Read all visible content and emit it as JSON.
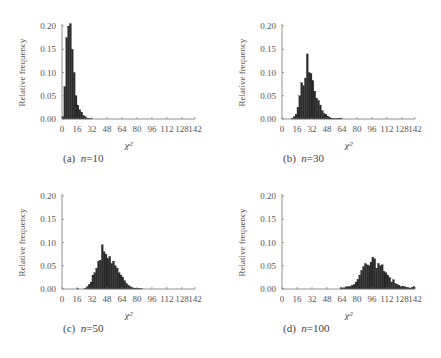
{
  "figure": {
    "bar_color": "#2b2b2b",
    "axis_color": "#777777"
  },
  "chart_data": [
    {
      "type": "bar",
      "panel": "a",
      "caption_prefix": "(a)",
      "caption_var": "n",
      "caption_value": "=10",
      "xlabel": "χ²",
      "ylabel": "Relative frequency",
      "ylim": [
        0,
        0.2
      ],
      "xlim": [
        0,
        142
      ],
      "yticks": [
        "0.00",
        "0.05",
        "0.10",
        "0.15",
        "0.20"
      ],
      "xticks": [
        "0",
        "16",
        "32",
        "48",
        "64",
        "80",
        "96",
        "112",
        "128",
        "142"
      ],
      "bin_width": 2,
      "x": [
        0,
        2,
        4,
        6,
        8,
        10,
        12,
        14,
        16,
        18,
        20,
        22,
        24,
        26,
        28,
        30
      ],
      "values": [
        0.005,
        0.07,
        0.175,
        0.2,
        0.205,
        0.15,
        0.1,
        0.05,
        0.03,
        0.02,
        0.015,
        0.008,
        0.005,
        0.002,
        0.001,
        0.001
      ]
    },
    {
      "type": "bar",
      "panel": "b",
      "caption_prefix": "(b)",
      "caption_var": "n",
      "caption_value": "=30",
      "xlabel": "χ²",
      "ylabel": "Relative frequency",
      "ylim": [
        0,
        0.2
      ],
      "xlim": [
        0,
        142
      ],
      "yticks": [
        "0.00",
        "0.05",
        "0.10",
        "0.15",
        "0.20"
      ],
      "xticks": [
        "0",
        "16",
        "32",
        "48",
        "64",
        "80",
        "96",
        "112",
        "128",
        "142"
      ],
      "bin_width": 2,
      "x": [
        10,
        12,
        14,
        16,
        18,
        20,
        22,
        24,
        26,
        28,
        30,
        32,
        34,
        36,
        38,
        40,
        42,
        44,
        46,
        48,
        50,
        52,
        54,
        56,
        58,
        60,
        62
      ],
      "values": [
        0.002,
        0.005,
        0.01,
        0.025,
        0.05,
        0.078,
        0.072,
        0.088,
        0.14,
        0.1,
        0.098,
        0.082,
        0.06,
        0.045,
        0.04,
        0.03,
        0.018,
        0.012,
        0.01,
        0.006,
        0.004,
        0.002,
        0.001,
        0.001,
        0.001,
        0.002,
        0.001
      ]
    },
    {
      "type": "bar",
      "panel": "c",
      "caption_prefix": "(c)",
      "caption_var": "n",
      "caption_value": "=50",
      "xlabel": "χ²",
      "ylabel": "Relative frequency",
      "ylim": [
        0,
        0.2
      ],
      "xlim": [
        0,
        142
      ],
      "yticks": [
        "0.00",
        "0.05",
        "0.10",
        "0.15",
        "0.20"
      ],
      "xticks": [
        "0",
        "16",
        "32",
        "48",
        "64",
        "80",
        "96",
        "112",
        "128",
        "142"
      ],
      "bin_width": 2,
      "x": [
        16,
        24,
        26,
        28,
        30,
        32,
        34,
        36,
        38,
        40,
        42,
        44,
        46,
        48,
        50,
        52,
        54,
        56,
        58,
        60,
        62,
        64,
        66,
        68,
        70,
        72,
        74,
        76,
        78,
        80,
        82,
        84
      ],
      "values": [
        0.001,
        0.002,
        0.005,
        0.01,
        0.015,
        0.03,
        0.035,
        0.045,
        0.06,
        0.062,
        0.095,
        0.08,
        0.075,
        0.065,
        0.07,
        0.055,
        0.06,
        0.05,
        0.045,
        0.035,
        0.03,
        0.025,
        0.018,
        0.012,
        0.008,
        0.005,
        0.003,
        0.002,
        0.002,
        0.001,
        0.001,
        0.001
      ]
    },
    {
      "type": "bar",
      "panel": "d",
      "caption_prefix": "(d)",
      "caption_var": "n",
      "caption_value": "=100",
      "xlabel": "χ²",
      "ylabel": "Relative frequency",
      "ylim": [
        0,
        0.2
      ],
      "xlim": [
        0,
        142
      ],
      "yticks": [
        "0.00",
        "0.05",
        "0.10",
        "0.15",
        "0.20"
      ],
      "xticks": [
        "0",
        "16",
        "32",
        "48",
        "64",
        "80",
        "96",
        "112",
        "128",
        "142"
      ],
      "bin_width": 2,
      "x": [
        62,
        64,
        66,
        68,
        70,
        72,
        74,
        76,
        78,
        80,
        82,
        84,
        86,
        88,
        90,
        92,
        94,
        96,
        98,
        100,
        102,
        104,
        106,
        108,
        110,
        112,
        114,
        116,
        118,
        120,
        122,
        124,
        126,
        128,
        130,
        132,
        134,
        136,
        138,
        140
      ],
      "values": [
        0.003,
        0.001,
        0.003,
        0.005,
        0.005,
        0.006,
        0.008,
        0.01,
        0.015,
        0.02,
        0.03,
        0.04,
        0.048,
        0.055,
        0.052,
        0.05,
        0.058,
        0.068,
        0.065,
        0.045,
        0.055,
        0.05,
        0.052,
        0.038,
        0.035,
        0.03,
        0.025,
        0.015,
        0.02,
        0.012,
        0.01,
        0.008,
        0.005,
        0.006,
        0.005,
        0.004,
        0.003,
        0.002,
        0.004,
        0.005
      ]
    }
  ]
}
